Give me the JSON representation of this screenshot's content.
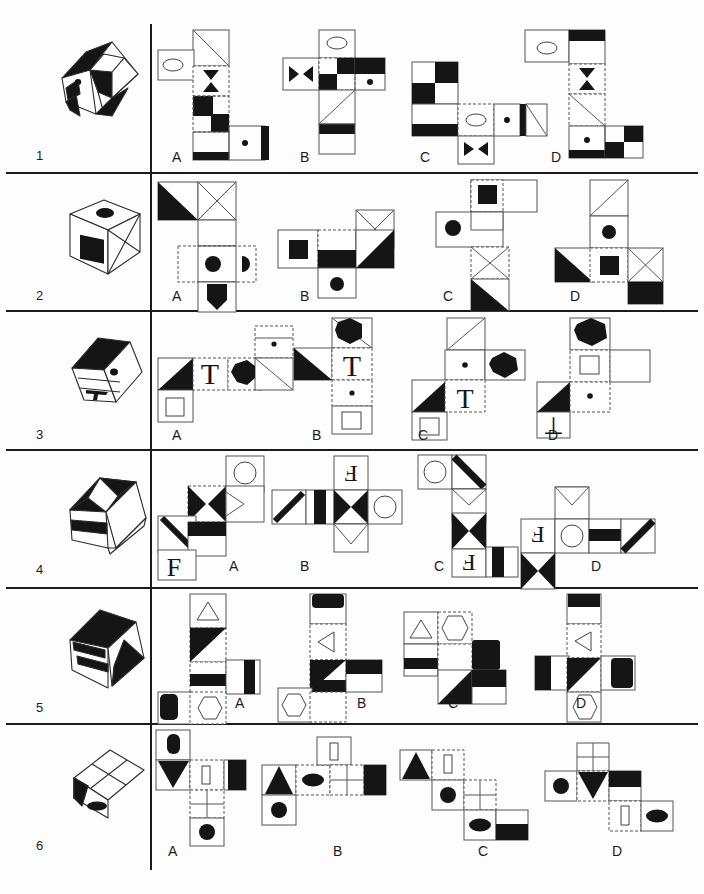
{
  "page": {
    "kind": "cube-folding-spatial-reasoning-test",
    "width": 704,
    "height": 894,
    "ink": "#151515",
    "paper": "#fdfdfd",
    "fill_black": "#151515",
    "fill_white": "#ffffff",
    "stroke_solid": "#4a4a4a",
    "stroke_dashed": "#6e6e6e",
    "divider_color": "#1b1b1b"
  },
  "option_labels": [
    "A",
    "B",
    "C",
    "D"
  ],
  "rows": [
    {
      "number": "1",
      "label_y": 155,
      "divider_y": 172,
      "cube": {
        "name": "cube-1",
        "faces": "checkerboard with dot"
      },
      "options": [
        {
          "label": "A",
          "label_x": 172,
          "label_y": 157
        },
        {
          "label": "B",
          "label_x": 300,
          "label_y": 157
        },
        {
          "label": "C",
          "label_x": 420,
          "label_y": 157
        },
        {
          "label": "D",
          "label_x": 551,
          "label_y": 157
        }
      ]
    },
    {
      "number": "2",
      "label_y": 295,
      "divider_y": 310,
      "cube": {
        "name": "cube-2",
        "faces": "black square, ellipse, X-cross"
      },
      "options": [
        {
          "label": "A",
          "label_x": 172,
          "label_y": 296
        },
        {
          "label": "B",
          "label_x": 300,
          "label_y": 296
        },
        {
          "label": "C",
          "label_x": 443,
          "label_y": 296
        },
        {
          "label": "D",
          "label_x": 570,
          "label_y": 296
        }
      ]
    },
    {
      "number": "3",
      "label_y": 434,
      "divider_y": 449,
      "cube": {
        "name": "cube-3",
        "faces": "T letter, dot, black triangle"
      },
      "options": [
        {
          "label": "A",
          "label_x": 172,
          "label_y": 435
        },
        {
          "label": "B",
          "label_x": 312,
          "label_y": 435
        },
        {
          "label": "C",
          "label_x": 418,
          "label_y": 435
        },
        {
          "label": "D",
          "label_x": 548,
          "label_y": 435
        }
      ]
    },
    {
      "number": "4",
      "label_y": 571,
      "divider_y": 587,
      "cube": {
        "name": "cube-4",
        "faces": "bowtie, stripe, F letter"
      },
      "options": [
        {
          "label": "A",
          "label_x": 229,
          "label_y": 566
        },
        {
          "label": "B",
          "label_x": 300,
          "label_y": 566
        },
        {
          "label": "C",
          "label_x": 434,
          "label_y": 566
        },
        {
          "label": "D",
          "label_x": 591,
          "label_y": 566
        }
      ]
    },
    {
      "number": "5",
      "label_y": 709,
      "divider_y": 723,
      "cube": {
        "name": "cube-5",
        "faces": "diagonal stripe, triangle, hexagon"
      },
      "options": [
        {
          "label": "A",
          "label_x": 235,
          "label_y": 703
        },
        {
          "label": "B",
          "label_x": 357,
          "label_y": 703
        },
        {
          "label": "C",
          "label_x": 448,
          "label_y": 703
        },
        {
          "label": "D",
          "label_x": 576,
          "label_y": 703
        }
      ]
    },
    {
      "number": "6",
      "label_y": 843,
      "divider_y": null,
      "cube": {
        "name": "cube-6",
        "faces": "grid, ellipse, black triangle"
      },
      "options": [
        {
          "label": "A",
          "label_x": 168,
          "label_y": 851
        },
        {
          "label": "B",
          "label_x": 333,
          "label_y": 851
        },
        {
          "label": "C",
          "label_x": 478,
          "label_y": 851
        },
        {
          "label": "D",
          "label_x": 612,
          "label_y": 851
        }
      ]
    }
  ]
}
